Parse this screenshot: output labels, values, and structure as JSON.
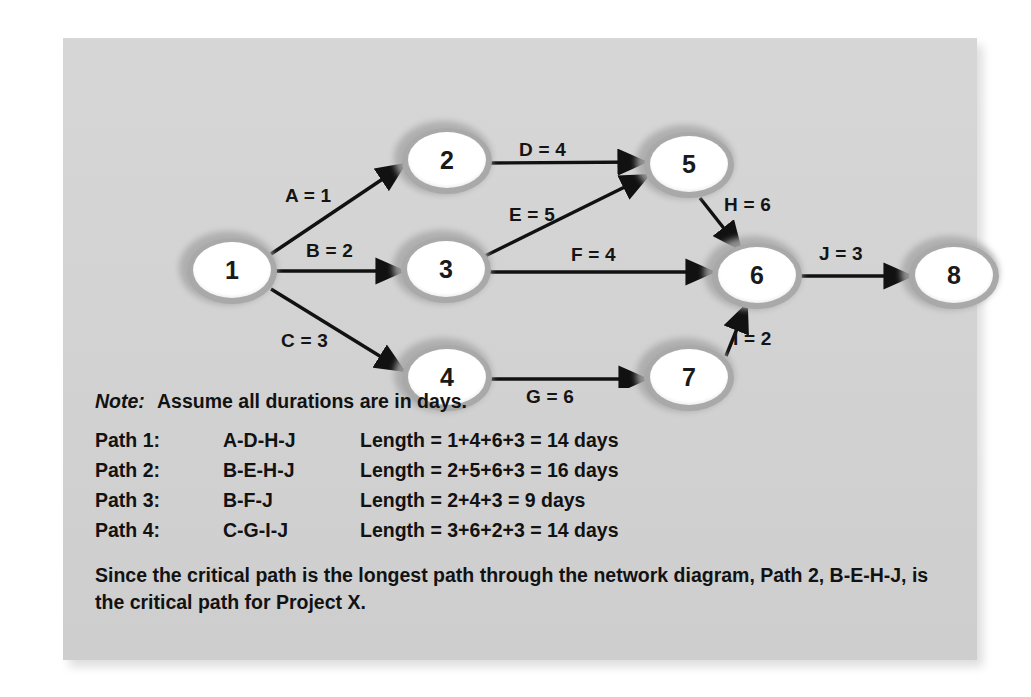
{
  "figure": {
    "background_color": "#d2d2d2",
    "node_fill": "#ffffff",
    "node_ring": "#a9a9a9",
    "edge_color": "#111111"
  },
  "diagram": {
    "type": "activity-on-arrow network diagram",
    "nodes": [
      {
        "id": "1",
        "label": "1",
        "cx": 168,
        "cy": 233
      },
      {
        "id": "2",
        "label": "2",
        "cx": 383,
        "cy": 123
      },
      {
        "id": "3",
        "label": "3",
        "cx": 382,
        "cy": 232
      },
      {
        "id": "4",
        "label": "4",
        "cx": 383,
        "cy": 340
      },
      {
        "id": "5",
        "label": "5",
        "cx": 625,
        "cy": 127
      },
      {
        "id": "6",
        "label": "6",
        "cx": 693,
        "cy": 238
      },
      {
        "id": "7",
        "label": "7",
        "cx": 625,
        "cy": 340
      },
      {
        "id": "8",
        "label": "8",
        "cx": 890,
        "cy": 238
      }
    ],
    "edges": [
      {
        "id": "A",
        "label": "A = 1",
        "activity": "A",
        "duration": 1,
        "from": "1",
        "to": "2",
        "label_x": 222,
        "label_y": 147
      },
      {
        "id": "B",
        "label": "B = 2",
        "activity": "B",
        "duration": 2,
        "from": "1",
        "to": "3",
        "label_x": 243,
        "label_y": 202
      },
      {
        "id": "C",
        "label": "C = 3",
        "activity": "C",
        "duration": 3,
        "from": "1",
        "to": "4",
        "label_x": 218,
        "label_y": 292
      },
      {
        "id": "D",
        "label": "D = 4",
        "activity": "D",
        "duration": 4,
        "from": "2",
        "to": "5",
        "label_x": 456,
        "label_y": 101
      },
      {
        "id": "E",
        "label": "E = 5",
        "activity": "E",
        "duration": 5,
        "from": "3",
        "to": "5",
        "label_x": 446,
        "label_y": 166
      },
      {
        "id": "F",
        "label": "F = 4",
        "activity": "F",
        "duration": 4,
        "from": "3",
        "to": "6",
        "label_x": 508,
        "label_y": 206
      },
      {
        "id": "G",
        "label": "G = 6",
        "activity": "G",
        "duration": 6,
        "from": "4",
        "to": "7",
        "label_x": 463,
        "label_y": 348
      },
      {
        "id": "H",
        "label": "H = 6",
        "activity": "H",
        "duration": 6,
        "from": "5",
        "to": "6",
        "label_x": 661,
        "label_y": 156
      },
      {
        "id": "I",
        "label": "I = 2",
        "activity": "I",
        "duration": 2,
        "from": "7",
        "to": "6",
        "label_x": 670,
        "label_y": 290
      },
      {
        "id": "J",
        "label": "J = 3",
        "activity": "J",
        "duration": 3,
        "from": "6",
        "to": "8",
        "label_x": 756,
        "label_y": 205
      }
    ]
  },
  "note": {
    "label": "Note:",
    "text": "Assume all durations are in days."
  },
  "paths": {
    "rows": [
      {
        "name": "Path 1:",
        "code": "A-D-H-J",
        "length": "Length = 1+4+6+3 = 14 days"
      },
      {
        "name": "Path 2:",
        "code": "B-E-H-J",
        "length": "Length = 2+5+6+3 = 16 days"
      },
      {
        "name": "Path 3:",
        "code": "B-F-J",
        "length": "Length = 2+4+3 = 9 days"
      },
      {
        "name": "Path 4:",
        "code": "C-G-I-J",
        "length": "Length = 3+6+2+3 = 14 days"
      }
    ]
  },
  "conclusion": {
    "text": "Since the critical path is the longest path through the network diagram, Path 2, B-E-H-J, is the critical path for Project X."
  }
}
